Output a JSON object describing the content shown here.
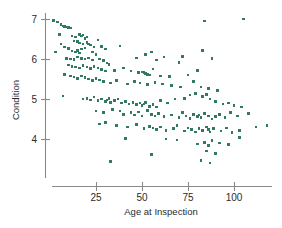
{
  "figure": {
    "background_color": "#ffffff",
    "axis_color": "#8a8a8a",
    "text_color": "#2b2b2b",
    "marker_color": "#2f7a60"
  },
  "chart_data": {
    "type": "scatter",
    "title": "",
    "xlabel": "Age at Inspection",
    "ylabel": "Condition",
    "xticks": [
      25,
      50,
      75,
      100
    ],
    "yticks": [
      4,
      5,
      6,
      7
    ],
    "xlim": [
      0,
      120
    ],
    "ylim": [
      3.2,
      7.2
    ],
    "grid": false,
    "legend": null,
    "marker": "square",
    "marker_color": "#2f7a60",
    "marker_size": 2.6,
    "n_points": 212,
    "relationship": "negative",
    "points": [
      [
        2,
        6.97
      ],
      [
        4,
        6.93
      ],
      [
        6,
        6.86
      ],
      [
        7,
        6.83
      ],
      [
        8,
        6.82
      ],
      [
        9,
        6.8
      ],
      [
        10,
        6.79
      ],
      [
        11,
        6.78
      ],
      [
        5,
        6.62
      ],
      [
        12,
        6.58
      ],
      [
        14,
        6.55
      ],
      [
        16,
        6.62
      ],
      [
        17,
        6.58
      ],
      [
        18,
        6.6
      ],
      [
        19,
        6.52
      ],
      [
        20,
        6.55
      ],
      [
        6,
        6.38
      ],
      [
        13,
        6.45
      ],
      [
        15,
        6.44
      ],
      [
        16,
        6.4
      ],
      [
        18,
        6.38
      ],
      [
        20,
        6.42
      ],
      [
        21,
        6.38
      ],
      [
        22,
        6.35
      ],
      [
        24,
        6.3
      ],
      [
        26,
        6.48
      ],
      [
        28,
        6.32
      ],
      [
        30,
        6.25
      ],
      [
        38,
        6.33
      ],
      [
        19,
        6.28
      ],
      [
        17,
        6.25
      ],
      [
        15,
        6.22
      ],
      [
        3,
        6.18
      ],
      [
        8,
        6.3
      ],
      [
        10,
        6.26
      ],
      [
        12,
        6.2
      ],
      [
        14,
        6.18
      ],
      [
        16,
        6.15
      ],
      [
        23,
        6.18
      ],
      [
        25,
        6.12
      ],
      [
        9,
        6.02
      ],
      [
        11,
        6.0
      ],
      [
        13,
        5.99
      ],
      [
        15,
        6.05
      ],
      [
        17,
        6.02
      ],
      [
        19,
        6.0
      ],
      [
        21,
        6.03
      ],
      [
        23,
        5.98
      ],
      [
        27,
        6.0
      ],
      [
        29,
        5.96
      ],
      [
        31,
        5.9
      ],
      [
        47,
        6.03
      ],
      [
        52,
        6.12
      ],
      [
        55,
        6.18
      ],
      [
        58,
        5.98
      ],
      [
        62,
        6.05
      ],
      [
        70,
        5.92
      ],
      [
        72,
        6.06
      ],
      [
        83,
        6.22
      ],
      [
        84,
        6.95
      ],
      [
        88,
        6.02
      ],
      [
        105,
        7.0
      ],
      [
        10,
        5.85
      ],
      [
        12,
        5.82
      ],
      [
        14,
        5.8
      ],
      [
        16,
        5.78
      ],
      [
        18,
        5.84
      ],
      [
        20,
        5.8
      ],
      [
        22,
        5.76
      ],
      [
        24,
        5.82
      ],
      [
        26,
        5.78
      ],
      [
        28,
        5.74
      ],
      [
        30,
        5.7
      ],
      [
        32,
        5.86
      ],
      [
        35,
        5.72
      ],
      [
        40,
        5.78
      ],
      [
        44,
        5.7
      ],
      [
        48,
        5.66
      ],
      [
        50,
        5.68
      ],
      [
        51,
        5.66
      ],
      [
        52,
        5.64
      ],
      [
        53,
        5.62
      ],
      [
        54,
        5.6
      ],
      [
        56,
        5.75
      ],
      [
        60,
        5.58
      ],
      [
        65,
        5.56
      ],
      [
        75,
        5.6
      ],
      [
        80,
        5.72
      ],
      [
        8,
        5.62
      ],
      [
        11,
        5.58
      ],
      [
        13,
        5.55
      ],
      [
        15,
        5.52
      ],
      [
        17,
        5.58
      ],
      [
        19,
        5.54
      ],
      [
        21,
        5.5
      ],
      [
        23,
        5.46
      ],
      [
        25,
        5.52
      ],
      [
        27,
        5.48
      ],
      [
        29,
        5.44
      ],
      [
        33,
        5.4
      ],
      [
        36,
        5.46
      ],
      [
        42,
        5.38
      ],
      [
        46,
        5.44
      ],
      [
        49,
        5.4
      ],
      [
        53,
        5.36
      ],
      [
        57,
        5.42
      ],
      [
        61,
        5.38
      ],
      [
        66,
        5.34
      ],
      [
        71,
        5.3
      ],
      [
        78,
        5.44
      ],
      [
        82,
        5.3
      ],
      [
        86,
        5.26
      ],
      [
        91,
        5.22
      ],
      [
        7,
        5.08
      ],
      [
        18,
        5.0
      ],
      [
        20,
        5.02
      ],
      [
        22,
        4.98
      ],
      [
        24,
        5.05
      ],
      [
        26,
        4.96
      ],
      [
        28,
        5.0
      ],
      [
        30,
        4.94
      ],
      [
        31,
        4.98
      ],
      [
        32,
        5.02
      ],
      [
        33,
        4.92
      ],
      [
        35,
        4.96
      ],
      [
        37,
        5.0
      ],
      [
        39,
        4.9
      ],
      [
        41,
        4.94
      ],
      [
        43,
        4.88
      ],
      [
        45,
        4.92
      ],
      [
        47,
        4.86
      ],
      [
        49,
        4.9
      ],
      [
        50,
        4.84
      ],
      [
        51,
        4.88
      ],
      [
        52,
        4.92
      ],
      [
        54,
        4.82
      ],
      [
        56,
        4.86
      ],
      [
        58,
        4.8
      ],
      [
        60,
        4.96
      ],
      [
        64,
        4.9
      ],
      [
        68,
        5.0
      ],
      [
        73,
        5.02
      ],
      [
        76,
        5.1
      ],
      [
        79,
        5.14
      ],
      [
        83,
        5.06
      ],
      [
        85,
        5.12
      ],
      [
        87,
        5.0
      ],
      [
        90,
        4.94
      ],
      [
        94,
        4.88
      ],
      [
        97,
        4.9
      ],
      [
        100,
        4.84
      ],
      [
        104,
        4.8
      ],
      [
        25,
        4.7
      ],
      [
        29,
        4.66
      ],
      [
        34,
        4.74
      ],
      [
        38,
        4.7
      ],
      [
        40,
        4.62
      ],
      [
        44,
        4.66
      ],
      [
        46,
        4.6
      ],
      [
        48,
        4.68
      ],
      [
        50,
        4.58
      ],
      [
        53,
        4.72
      ],
      [
        55,
        4.62
      ],
      [
        57,
        4.58
      ],
      [
        59,
        4.64
      ],
      [
        62,
        4.56
      ],
      [
        66,
        4.6
      ],
      [
        70,
        4.54
      ],
      [
        72,
        4.66
      ],
      [
        74,
        4.58
      ],
      [
        76,
        4.52
      ],
      [
        78,
        4.62
      ],
      [
        80,
        4.56
      ],
      [
        81,
        4.6
      ],
      [
        82,
        4.54
      ],
      [
        84,
        4.64
      ],
      [
        86,
        4.58
      ],
      [
        88,
        4.5
      ],
      [
        90,
        4.56
      ],
      [
        92,
        4.62
      ],
      [
        95,
        4.54
      ],
      [
        98,
        4.66
      ],
      [
        102,
        4.58
      ],
      [
        108,
        4.64
      ],
      [
        118,
        4.34
      ],
      [
        112,
        4.3
      ],
      [
        27,
        4.38
      ],
      [
        30,
        4.42
      ],
      [
        36,
        4.34
      ],
      [
        42,
        4.3
      ],
      [
        47,
        4.36
      ],
      [
        51,
        4.26
      ],
      [
        54,
        4.32
      ],
      [
        56,
        4.28
      ],
      [
        58,
        4.24
      ],
      [
        60,
        4.3
      ],
      [
        63,
        4.22
      ],
      [
        67,
        4.26
      ],
      [
        69,
        4.34
      ],
      [
        73,
        4.2
      ],
      [
        75,
        4.28
      ],
      [
        77,
        4.24
      ],
      [
        79,
        4.18
      ],
      [
        81,
        4.26
      ],
      [
        83,
        4.22
      ],
      [
        85,
        4.3
      ],
      [
        86,
        4.24
      ],
      [
        87,
        4.18
      ],
      [
        89,
        4.26
      ],
      [
        93,
        4.2
      ],
      [
        96,
        4.28
      ],
      [
        99,
        4.16
      ],
      [
        103,
        4.22
      ],
      [
        41,
        4.02
      ],
      [
        63,
        4.0
      ],
      [
        69,
        3.98
      ],
      [
        80,
        3.88
      ],
      [
        84,
        3.92
      ],
      [
        86,
        3.84
      ],
      [
        88,
        3.96
      ],
      [
        92,
        3.9
      ],
      [
        97,
        3.86
      ],
      [
        103,
        4.04
      ],
      [
        85,
        3.7
      ],
      [
        90,
        3.64
      ],
      [
        55,
        3.62
      ],
      [
        82,
        3.46
      ],
      [
        33,
        3.44
      ],
      [
        87,
        3.4
      ]
    ]
  },
  "axis_titles": {
    "x": "Age at Inspection",
    "y": "Condition"
  },
  "tick_labels": {
    "x": [
      "25",
      "50",
      "75",
      "100"
    ],
    "y": [
      "7",
      "6",
      "5",
      "4"
    ]
  }
}
